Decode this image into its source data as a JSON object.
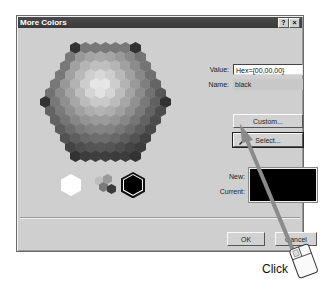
{
  "dialog": {
    "title": "More Colors",
    "help_button": "?",
    "close_button": "×",
    "value_label": "Value:",
    "value_input": "Hex={00,00,00}",
    "name_label": "Name:",
    "name_value": "black",
    "custom_button": "Custom...",
    "select_button": "Select...",
    "new_label": "New:",
    "current_label": "Current:",
    "new_color": "#000000",
    "current_color": "#000000",
    "ok_button": "OK",
    "cancel_button": "Cancel"
  },
  "palette": {
    "icon": "hexagon-color-palette",
    "grayscale_selected": "black"
  },
  "annotation": {
    "label": "Click",
    "icon": "mouse-icon",
    "arrow_target": "select-button"
  }
}
